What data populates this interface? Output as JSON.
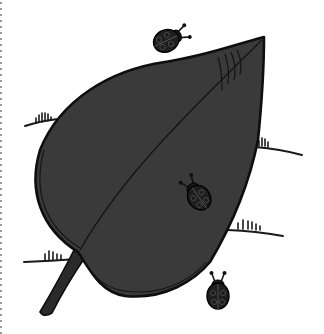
{
  "title": "Leaf with ladybugs coloring illustration",
  "colors": {
    "background": "#ffffff",
    "leaf_fill": "#3a3a3a",
    "outline": "#111111",
    "ladybug": "#1e1e1e",
    "border_dots": "#9a9a9a"
  },
  "illustration": {
    "leaf": {
      "tip": [
        264,
        37
      ],
      "stem_base": [
        42,
        315
      ]
    },
    "ladybugs": [
      {
        "name": "top-ladybug",
        "cx": 168,
        "cy": 38,
        "rotation": -25
      },
      {
        "name": "leaf-ladybug",
        "cx": 197,
        "cy": 195,
        "rotation": -20
      },
      {
        "name": "bottom-ladybug",
        "cx": 218,
        "cy": 292,
        "rotation": 0
      }
    ],
    "grass_tufts": [
      {
        "name": "grass-left-top"
      },
      {
        "name": "grass-right-top"
      },
      {
        "name": "grass-right-bottom"
      },
      {
        "name": "grass-left-bottom"
      }
    ]
  }
}
